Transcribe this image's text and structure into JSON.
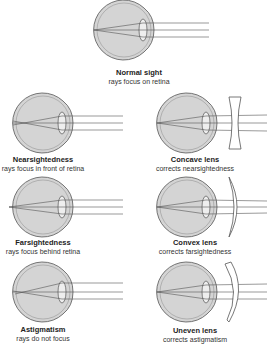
{
  "diagram": {
    "colors": {
      "eye_fill": "#d4d4d4",
      "stroke": "#555555",
      "lens_fill": "#eeeeee",
      "background": "#ffffff"
    },
    "panels": [
      {
        "id": "normal",
        "title": "Normal sight",
        "subtitle": "rays focus on retina"
      },
      {
        "id": "myopia",
        "title": "Nearsightedness",
        "subtitle": "rays focus in front of retina"
      },
      {
        "id": "concave",
        "title": "Concave lens",
        "subtitle": "corrects nearsightedness"
      },
      {
        "id": "hyperopia",
        "title": "Farsightedness",
        "subtitle": "rays focus behind retina"
      },
      {
        "id": "convex",
        "title": "Convex lens",
        "subtitle": "corrects farsightedness"
      },
      {
        "id": "astigmatism",
        "title": "Astigmatism",
        "subtitle": "rays do not focus"
      },
      {
        "id": "uneven",
        "title": "Uneven lens",
        "subtitle": "corrects astigmatism"
      }
    ]
  }
}
